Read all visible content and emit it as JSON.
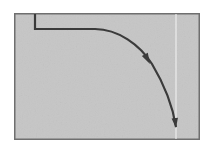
{
  "figure": {
    "kind": "scanned-line-figure",
    "canvas": {
      "width": 213,
      "height": 150
    },
    "page_background": "#ffffff",
    "plot_area": {
      "name": "bordered-panel",
      "x": 14,
      "y": 13,
      "width": 186,
      "height": 127,
      "fill": "#c6c6c6",
      "border_color": "#6f6f6f",
      "border_width": 1.5,
      "texture": "paper-grain-noise"
    },
    "guide_line": {
      "name": "vertical-white-guide",
      "orientation": "vertical",
      "x": 176,
      "y_start": 14,
      "y_end": 139,
      "color": "#eeeeee",
      "width": 1.2
    },
    "curve": {
      "name": "elbow-decay-curve",
      "color": "#3a3a3a",
      "stroke_width": 2.2,
      "description": "vertical drop, horizontal plateau, then convex decay to vertical",
      "points": [
        {
          "x": 35,
          "y": 14
        },
        {
          "x": 35,
          "y": 29
        },
        {
          "x": 95,
          "y": 29
        },
        {
          "x": 120,
          "y": 33
        },
        {
          "x": 142,
          "y": 48
        },
        {
          "x": 157,
          "y": 70
        },
        {
          "x": 168,
          "y": 98
        },
        {
          "x": 174,
          "y": 118
        },
        {
          "x": 176,
          "y": 127
        }
      ],
      "path": "M 35 14 L 35 29 L 95 29 C 118 29 140 45 152 64 C 164 84 173 108 176 127"
    },
    "arrowheads": [
      {
        "name": "mid-curve-arrowhead",
        "x": 150,
        "y": 64,
        "angle_deg": 62,
        "length": 11,
        "half_width": 3.4,
        "color": "#3a3a3a"
      },
      {
        "name": "curve-end-arrowhead",
        "x": 176,
        "y": 128,
        "angle_deg": 83,
        "length": 10,
        "half_width": 3.2,
        "color": "#3a3a3a"
      }
    ],
    "labels": []
  }
}
